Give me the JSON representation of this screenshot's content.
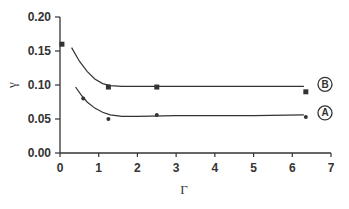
{
  "chart_data": {
    "type": "scatter",
    "title": "",
    "xlabel": "Γ",
    "ylabel": "γ",
    "xlim": [
      0,
      7
    ],
    "ylim": [
      0,
      0.2
    ],
    "x_ticks": [
      "0",
      "1",
      "2",
      "3",
      "4",
      "5",
      "6",
      "7"
    ],
    "y_ticks": [
      "0.00",
      "0.05",
      "0.10",
      "0.15",
      "0.20"
    ],
    "grid": false,
    "legend_position": "inline-right",
    "series": [
      {
        "name": "B",
        "marker": "square",
        "points": [
          {
            "x": 0.05,
            "y": 0.16
          },
          {
            "x": 1.25,
            "y": 0.097
          },
          {
            "x": 2.5,
            "y": 0.097
          },
          {
            "x": 6.35,
            "y": 0.09
          }
        ],
        "fit_curve": [
          [
            0.3,
            0.155
          ],
          [
            0.5,
            0.135
          ],
          [
            0.7,
            0.12
          ],
          [
            0.9,
            0.109
          ],
          [
            1.1,
            0.102
          ],
          [
            1.3,
            0.099
          ],
          [
            1.6,
            0.098
          ],
          [
            2.0,
            0.098
          ],
          [
            3.0,
            0.098
          ],
          [
            4.0,
            0.098
          ],
          [
            5.0,
            0.098
          ],
          [
            6.3,
            0.098
          ]
        ]
      },
      {
        "name": "A",
        "marker": "dot",
        "points": [
          {
            "x": 0.6,
            "y": 0.08
          },
          {
            "x": 1.25,
            "y": 0.05
          },
          {
            "x": 2.5,
            "y": 0.056
          },
          {
            "x": 6.35,
            "y": 0.053
          }
        ],
        "fit_curve": [
          [
            0.4,
            0.097
          ],
          [
            0.55,
            0.085
          ],
          [
            0.7,
            0.075
          ],
          [
            0.9,
            0.066
          ],
          [
            1.1,
            0.06
          ],
          [
            1.3,
            0.056
          ],
          [
            1.6,
            0.054
          ],
          [
            2.0,
            0.054
          ],
          [
            3.0,
            0.055
          ],
          [
            4.0,
            0.055
          ],
          [
            5.0,
            0.055
          ],
          [
            6.3,
            0.056
          ]
        ]
      }
    ]
  },
  "colors": {
    "ink": "#333333",
    "background": "#ffffff"
  }
}
